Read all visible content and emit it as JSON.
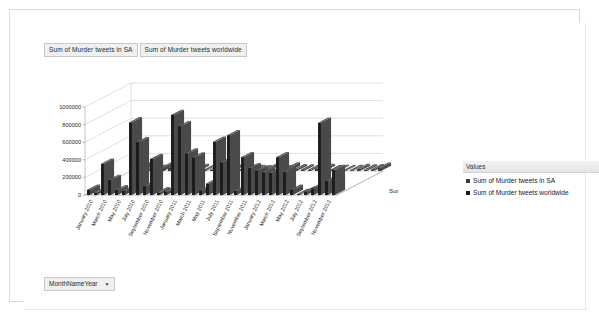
{
  "window": {
    "background": "#ffffff",
    "frame_color": "#d9d9d9"
  },
  "field_buttons": [
    {
      "label": "Sum of Murder tweets in SA"
    },
    {
      "label": "Sum of Murder tweets worldwide"
    }
  ],
  "filter": {
    "label": "MonthNameYear",
    "caret": "▼"
  },
  "legend": {
    "title": "Values",
    "entries": [
      {
        "label": "Sum of Murder tweets in SA",
        "color": "#3a3a3a"
      },
      {
        "label": "Sum of Murder tweets worldwide",
        "color": "#1c1c1c"
      }
    ]
  },
  "chart_data": {
    "type": "bar",
    "title": "",
    "subtitle": "",
    "xlabel": "",
    "ylabel": "",
    "zlabel": "Sum of Murder tweets in SA",
    "ylim": [
      0,
      1000000
    ],
    "ytick_labels": [
      "0",
      "200000",
      "400000",
      "600000",
      "800000",
      "1000000"
    ],
    "ytick_values": [
      0,
      200000,
      400000,
      600000,
      800000,
      1000000
    ],
    "grid": true,
    "legend_position": "right",
    "three_d": true,
    "categories": [
      "January 2010",
      "February 2010",
      "March 2010",
      "April 2010",
      "May 2010",
      "June 2010",
      "July 2010",
      "August 2010",
      "September 2010",
      "October 2010",
      "November 2010",
      "December 2010",
      "January 2011",
      "February 2011",
      "March 2011",
      "April 2011",
      "May 2011",
      "June 2011",
      "July 2011",
      "August 2011",
      "September 2011",
      "October 2011",
      "November 2011",
      "December 2011",
      "January 2012",
      "February 2012",
      "March 2012",
      "April 2012",
      "May 2012",
      "June 2012",
      "July 2012",
      "August 2012",
      "September 2012",
      "October 2012",
      "November 2012",
      "December 2012"
    ],
    "xtick_labels": [
      "January 2010",
      "March 2010",
      "May 2010",
      "July 2010",
      "September 2010",
      "November 2010",
      "January 2011",
      "March 2011",
      "May 2011",
      "July 2011",
      "September 2011",
      "November 2011",
      "January 2012",
      "March 2012",
      "May 2012",
      "July 2012",
      "September 2012",
      "November 2012"
    ],
    "series": [
      {
        "name": "Sum of Murder tweets in SA",
        "color": "#3a3a3a",
        "values": [
          80000,
          42000,
          18000,
          12000,
          40000,
          34000,
          26000,
          90000,
          14000,
          22000,
          12000,
          16000,
          26000,
          10000,
          16000,
          8000,
          14000,
          10000,
          8000,
          26000,
          12000,
          9000,
          40000,
          20000,
          18000,
          14000,
          30000,
          22000,
          9000,
          10000,
          8000,
          10000,
          22000,
          16000,
          20000,
          36000
        ]
      },
      {
        "name": "Sum of Murder tweets worldwide",
        "color": "#1c1c1c",
        "values": [
          60000,
          30000,
          355000,
          170000,
          55000,
          45000,
          825000,
          600000,
          100000,
          410000,
          30000,
          40000,
          910000,
          780000,
          470000,
          425000,
          50000,
          130000,
          605000,
          370000,
          680000,
          45000,
          430000,
          305000,
          275000,
          255000,
          250000,
          430000,
          260000,
          60000,
          10000,
          40000,
          75000,
          820000,
          160000,
          285000
        ]
      }
    ]
  }
}
